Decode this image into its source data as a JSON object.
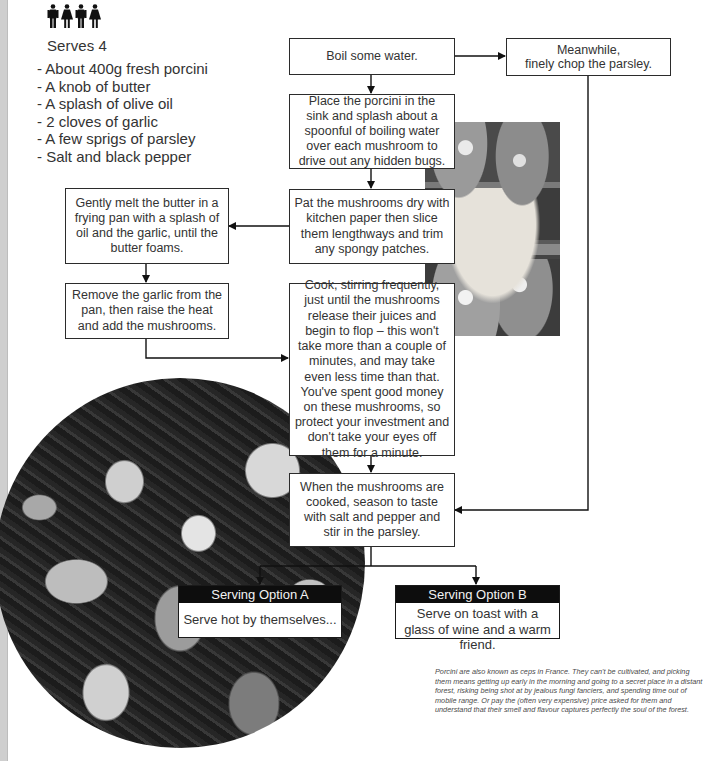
{
  "recipe": {
    "serves_icons": [
      "man-icon",
      "woman-icon",
      "man-icon",
      "woman-icon"
    ],
    "serves_label": "Serves 4",
    "ingredients": [
      "About 400g fresh porcini",
      "A knob of butter",
      "A splash of olive oil",
      "2 cloves of garlic",
      "A few sprigs of parsley",
      "Salt and black pepper"
    ]
  },
  "flowchart": {
    "steps": {
      "boil": "Boil some water.",
      "parsley": "Meanwhile,\nfinely chop the parsley.",
      "place": "Place the porcini in the sink and splash about a spoonful of boiling water over each mushroom to drive out any hidden bugs.",
      "pat": "Pat the mushrooms dry with kitchen paper then slice them lengthways and trim any spongy patches.",
      "melt": "Gently melt the butter in a frying pan with a splash of oil and the garlic, until the butter foams.",
      "remove": "Remove the garlic from the pan, then raise the heat and add the mushrooms.",
      "cook": "Cook, stirring frequently, just until the mushrooms release their juices and begin to flop – this won't take more than a couple of minutes, and may take even less time than that. You've spent good money on these mushrooms, so protect your investment and don't take your eyes off them for a minute.",
      "season": "When the mushrooms are cooked, season to taste with salt and pepper and stir in the parsley."
    },
    "options": [
      {
        "title": "Serving Option A",
        "text": "Serve hot by themselves..."
      },
      {
        "title": "Serving Option B",
        "text": "Serve on toast with a glass of wine and a warm friend."
      }
    ]
  },
  "images": {
    "crates_photo": "porcini mushrooms in market crates (photo)",
    "pan_photo": "sautéed porcini close-up (circular photo)"
  },
  "note": "Porcini are also known as ceps in France. They can't be cultivated, and picking them means getting up early in the morning and going to a secret place in a distant forest, risking being shot at by jealous fungi fanciers, and spending time out of mobile range. Or pay the (often very expensive) price asked for them and understand that their smell and flavour captures perfectly the soul of the forest."
}
